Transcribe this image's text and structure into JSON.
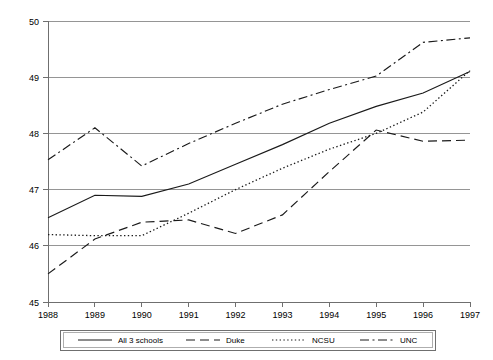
{
  "chart_data": {
    "type": "line",
    "title": "",
    "subtitle": "",
    "xlabel": "",
    "ylabel": "",
    "x": [
      1988,
      1989,
      1990,
      1991,
      1992,
      1993,
      1994,
      1995,
      1996,
      1997
    ],
    "xtick_labels": [
      "1988",
      "1989",
      "1990",
      "1991",
      "1992",
      "1993",
      "1994",
      "1995",
      "1996",
      "1997"
    ],
    "ytick_labels": [
      "45",
      "46",
      "47",
      "48",
      "49",
      "50"
    ],
    "ytick_values": [
      45,
      46,
      47,
      48,
      49,
      50
    ],
    "xlim": [
      1988,
      1997
    ],
    "ylim": [
      45,
      50
    ],
    "grid": "horizontal",
    "legend_position": "bottom",
    "series": [
      {
        "name": "All 3 schools",
        "line_style": "solid",
        "color": "#1a1a1a",
        "values": [
          46.5,
          46.9,
          46.88,
          47.1,
          47.45,
          47.8,
          48.18,
          48.48,
          48.72,
          49.1
        ]
      },
      {
        "name": "Duke",
        "line_style": "dashed",
        "color": "#1a1a1a",
        "values": [
          45.5,
          46.12,
          46.42,
          46.46,
          46.22,
          46.55,
          47.32,
          48.06,
          47.86,
          47.88
        ]
      },
      {
        "name": "NCSU",
        "line_style": "dotted",
        "color": "#1a1a1a",
        "values": [
          46.2,
          46.18,
          46.18,
          46.58,
          47.0,
          47.38,
          47.72,
          48.0,
          48.38,
          49.12
        ]
      },
      {
        "name": "UNC",
        "line_style": "dash-dot",
        "color": "#1a1a1a",
        "values": [
          47.53,
          48.1,
          47.42,
          47.82,
          48.18,
          48.52,
          48.78,
          49.02,
          49.62,
          49.7
        ]
      }
    ]
  },
  "legend": {
    "entries": [
      {
        "label": "All 3 schools",
        "style": "solid"
      },
      {
        "label": "Duke",
        "style": "dashed"
      },
      {
        "label": "NCSU",
        "style": "dotted"
      },
      {
        "label": "UNC",
        "style": "dash-dot"
      }
    ]
  },
  "colors": {
    "line": "#1a1a1a",
    "grid": "#8a8a8a",
    "axis": "#6f6f6f",
    "background": "#ffffff",
    "text": "#000000"
  }
}
